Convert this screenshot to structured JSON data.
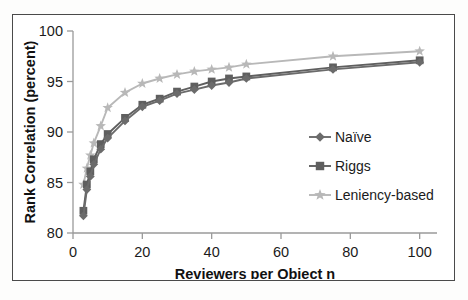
{
  "chart_data": {
    "type": "line",
    "title": "",
    "xlabel": "Reviewers per Object n",
    "ylabel": "Rank Correlation (percent)",
    "xlim": [
      0,
      105
    ],
    "ylim": [
      80,
      100
    ],
    "xticks": [
      0,
      20,
      40,
      60,
      80,
      100
    ],
    "yticks": [
      80,
      85,
      90,
      95,
      100
    ],
    "grid": false,
    "legend_position": "inside-right",
    "x": [
      3,
      4,
      5,
      6,
      8,
      10,
      15,
      20,
      25,
      30,
      35,
      40,
      45,
      50,
      75,
      100
    ],
    "series": [
      {
        "name": "Naïve",
        "marker": "diamond",
        "color": "#6b6b6b",
        "values": [
          81.7,
          84.3,
          85.6,
          86.8,
          88.3,
          89.4,
          91.1,
          92.5,
          93.1,
          93.8,
          94.2,
          94.6,
          94.9,
          95.3,
          96.2,
          96.9
        ]
      },
      {
        "name": "Riggs",
        "marker": "square",
        "color": "#5f5f5f",
        "values": [
          82.2,
          84.8,
          86.1,
          87.3,
          88.8,
          89.8,
          91.4,
          92.7,
          93.3,
          94.0,
          94.5,
          95.0,
          95.3,
          95.5,
          96.4,
          97.1
        ]
      },
      {
        "name": "Leniency-based",
        "marker": "star",
        "color": "#b8b8b8",
        "values": [
          84.8,
          86.4,
          87.7,
          88.9,
          90.6,
          92.4,
          93.9,
          94.8,
          95.3,
          95.7,
          96.0,
          96.2,
          96.4,
          96.7,
          97.5,
          98.0
        ]
      }
    ]
  },
  "legend": {
    "items": [
      {
        "label": "Naïve"
      },
      {
        "label": "Riggs"
      },
      {
        "label": "Leniency-based"
      }
    ]
  },
  "axes": {
    "x_title": "Reviewers per Object n",
    "y_title": "Rank Correlation (percent)",
    "x_tick_labels": [
      "0",
      "20",
      "40",
      "60",
      "80",
      "100"
    ],
    "y_tick_labels": [
      "80",
      "85",
      "90",
      "95",
      "100"
    ]
  },
  "colors": {
    "naive": "#6b6b6b",
    "riggs": "#5f5f5f",
    "leniency": "#b8b8b8",
    "axis": "#9a9a9a",
    "frame": "#4a4a4a",
    "text": "#1b1b1b"
  }
}
